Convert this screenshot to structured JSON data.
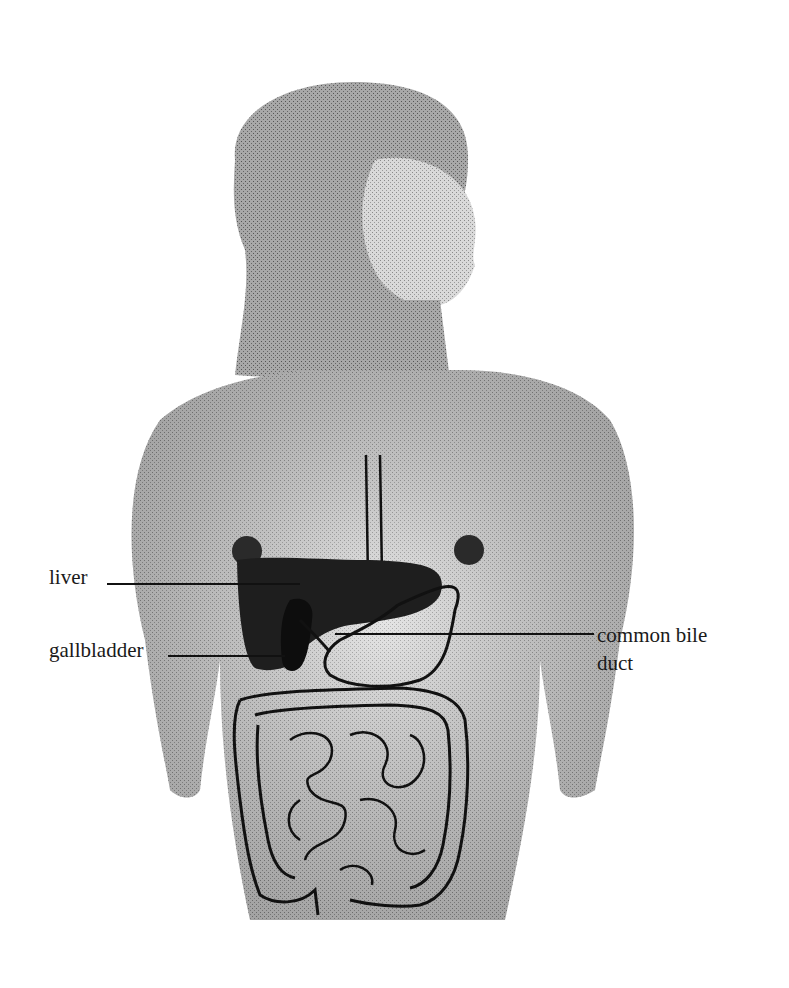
{
  "figure": {
    "labels": {
      "liver": "liver",
      "gallbladder": "gallbladder",
      "common_bile_duct_line1": "common bile",
      "common_bile_duct_line2": "duct"
    }
  },
  "colors": {
    "background": "#ffffff",
    "skin_shade": "#bdbdbd",
    "organ_dark": "#1e1e1e",
    "outline": "#111111",
    "text": "#1a1a1a"
  }
}
